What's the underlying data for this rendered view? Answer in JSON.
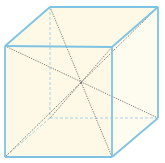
{
  "diagram": {
    "type": "cube-with-space-diagonals",
    "colors": {
      "edge": "#7ec3e3",
      "hidden_edge": "#a9cfe0",
      "diagonal": "#6b6b6b",
      "face_fill": "#fdf9e6",
      "background": "#ffffff"
    },
    "vertices": {
      "front_top_left": [
        5,
        46
      ],
      "front_top_right": [
        112,
        47
      ],
      "front_bottom_left": [
        5,
        157
      ],
      "front_bottom_right": [
        112,
        157
      ],
      "back_top_left": [
        50,
        7
      ],
      "back_top_right": [
        158,
        7
      ],
      "back_bottom_left": [
        50,
        118
      ],
      "back_bottom_right": [
        158,
        118
      ]
    },
    "center": [
      81,
      83
    ]
  }
}
